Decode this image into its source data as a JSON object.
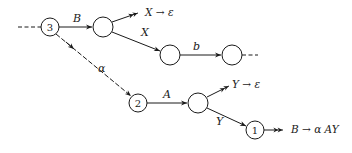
{
  "diagram": {
    "type": "state-transition-graph",
    "nodes": [
      {
        "id": "n3",
        "label": "3",
        "x": 50,
        "y": 27
      },
      {
        "id": "nB",
        "label": "",
        "x": 103,
        "y": 27
      },
      {
        "id": "nX",
        "label": "",
        "x": 170,
        "y": 55
      },
      {
        "id": "nb",
        "label": "",
        "x": 232,
        "y": 55
      },
      {
        "id": "n2",
        "label": "2",
        "x": 138,
        "y": 103
      },
      {
        "id": "nA",
        "label": "",
        "x": 198,
        "y": 103
      },
      {
        "id": "n1",
        "label": "1",
        "x": 255,
        "y": 130
      }
    ],
    "edges": [
      {
        "from": "n3",
        "to": "nB",
        "label": "B"
      },
      {
        "from": "nB",
        "to": "nX",
        "label": "X"
      },
      {
        "from": "nX",
        "to": "nb",
        "label": "b"
      },
      {
        "from": "n3",
        "to": "n2",
        "label": "α",
        "style": "dashed"
      },
      {
        "from": "n2",
        "to": "nA",
        "label": "A"
      },
      {
        "from": "nA",
        "to": "n1",
        "label": "Y"
      }
    ],
    "reductions": [
      {
        "at": "nB",
        "text": "X → ε"
      },
      {
        "at": "nA",
        "text": "Y → ε"
      },
      {
        "at": "n1",
        "text": "B → α AY"
      }
    ],
    "edge_labels": {
      "B": "B",
      "X": "X",
      "b": "b",
      "alpha": "α",
      "A": "A",
      "Y": "Y"
    },
    "node_labels": {
      "n3": "3",
      "n2": "2",
      "n1": "1"
    },
    "reduction_labels": {
      "x_eps": "X → ε",
      "y_eps": "Y → ε",
      "b_rule": "B → α AY"
    }
  }
}
